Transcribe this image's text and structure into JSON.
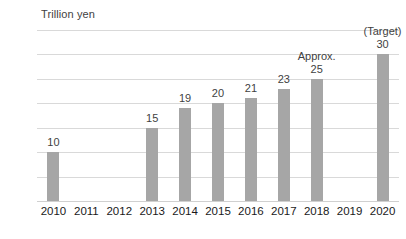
{
  "chart_data": {
    "type": "bar",
    "title": "",
    "ylabel": "Trillion yen",
    "xlabel": "",
    "ylim": [
      0,
      35
    ],
    "yticks": [
      0,
      5,
      10,
      15,
      20,
      25,
      30,
      35
    ],
    "grid": true,
    "legend": "none",
    "bar_color": "#a6a6a6",
    "gridline_color": "#d9d9d9",
    "categories": [
      "2010",
      "2011",
      "2012",
      "2013",
      "2014",
      "2015",
      "2016",
      "2017",
      "2018",
      "2019",
      "2020"
    ],
    "values": [
      10,
      null,
      null,
      15,
      19,
      20,
      21,
      23,
      25,
      null,
      30
    ],
    "data_labels": [
      "10",
      "",
      "",
      "15",
      "19",
      "20",
      "21",
      "23",
      "25",
      "",
      "30"
    ],
    "annotations": [
      {
        "category": "2018",
        "text": "Approx."
      },
      {
        "category": "2020",
        "text": "(Target)"
      }
    ]
  }
}
